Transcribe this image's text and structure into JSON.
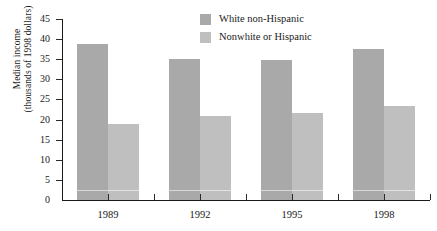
{
  "chart_data": {
    "type": "bar",
    "title": "",
    "subtitle": "",
    "xlabel": "",
    "ylabel": "Median income (thousands of 1998 dollars)",
    "ylabel_line1": "Median income",
    "ylabel_line2": "(thousands of 1998 dollars)",
    "categories": [
      "1989",
      "1992",
      "1995",
      "1998"
    ],
    "series": [
      {
        "name": "White non-Hispanic",
        "color": "#a9a9a9",
        "values": [
          38.8,
          35.0,
          34.8,
          37.6
        ]
      },
      {
        "name": "Nonwhite or Hispanic",
        "color": "#bfbfbf",
        "values": [
          18.8,
          21.0,
          21.7,
          23.3
        ]
      }
    ],
    "ylim": [
      0,
      45
    ],
    "yticks": [
      0,
      5,
      10,
      15,
      20,
      25,
      30,
      35,
      40,
      45
    ],
    "ytick_labels": [
      "0",
      "5",
      "10",
      "15",
      "20",
      "25",
      "30",
      "35",
      "40",
      "45"
    ],
    "grid": false,
    "legend_position": "top-center"
  },
  "legend": {
    "items": [
      {
        "label": "White non-Hispanic",
        "color": "#a9a9a9"
      },
      {
        "label": "Nonwhite or Hispanic",
        "color": "#bfbfbf"
      }
    ]
  },
  "colors": {
    "series_white_non_hispanic": "#a9a9a9",
    "series_nonwhite_or_hispanic": "#bfbfbf",
    "axis": "#1a1a1a",
    "background": "#ffffff"
  }
}
